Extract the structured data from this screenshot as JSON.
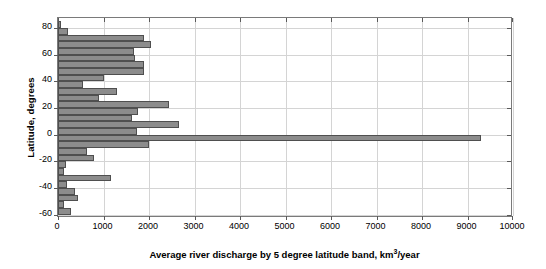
{
  "chart_data": {
    "type": "bar",
    "orientation": "horizontal",
    "title": "",
    "xlabel": "Average river discharge by 5 degree latitude band, km³/year",
    "ylabel": "Latitude, degrees",
    "xlim": [
      0,
      10000
    ],
    "ylim": [
      -62.5,
      87.5
    ],
    "xticks": [
      0,
      1000,
      2000,
      3000,
      4000,
      5000,
      6000,
      7000,
      8000,
      9000,
      10000
    ],
    "xticklabels": [
      "0",
      "1000",
      "2000",
      "3000",
      "4000",
      "5000",
      "6000",
      "7000",
      "8000",
      "9000",
      "10000"
    ],
    "yticks": [
      -60,
      -40,
      -20,
      0,
      20,
      40,
      60,
      80
    ],
    "yticklabels": [
      "-60",
      "-40",
      "-20",
      "0",
      "20",
      "40",
      "60",
      "80"
    ],
    "grid": true,
    "grid_axis": "both",
    "legend": null,
    "bar_color": "#8c8c8c",
    "bar_edge_color": "#4f4f4f",
    "bin_width_degrees": 5,
    "categories": [
      82.5,
      77.5,
      72.5,
      67.5,
      62.5,
      57.5,
      52.5,
      47.5,
      42.5,
      37.5,
      32.5,
      27.5,
      22.5,
      17.5,
      12.5,
      7.5,
      2.5,
      -2.5,
      -7.5,
      -12.5,
      -17.5,
      -22.5,
      -27.5,
      -32.5,
      -37.5,
      -42.5,
      -47.5,
      -52.5,
      -57.5
    ],
    "values": [
      60,
      230,
      1890,
      2040,
      1660,
      1700,
      1900,
      1890,
      1000,
      550,
      1290,
      900,
      2440,
      1750,
      1630,
      2670,
      1740,
      9300,
      1990,
      640,
      790,
      170,
      130,
      1160,
      200,
      380,
      450,
      140,
      290
    ]
  }
}
